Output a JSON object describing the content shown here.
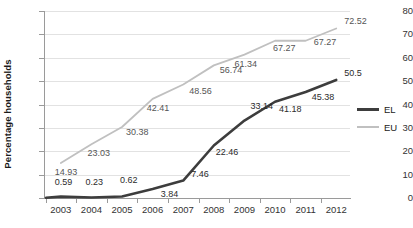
{
  "chart_data": {
    "type": "line",
    "title": "",
    "xlabel": "",
    "ylabel": "Percentage households",
    "categories": [
      "2003",
      "2004",
      "2005",
      "2006",
      "2007",
      "2008",
      "2009",
      "2010",
      "2011",
      "2012"
    ],
    "ylim": [
      0,
      80
    ],
    "yticks": [
      0,
      10,
      20,
      30,
      40,
      50,
      60,
      70,
      80
    ],
    "grid": true,
    "legend_position": "right",
    "series": [
      {
        "name": "EL",
        "color": "#3d3d3d",
        "values": [
          0.59,
          0.23,
          0.62,
          3.84,
          7.46,
          22.46,
          33.14,
          41.18,
          45.38,
          50.5
        ],
        "labels": [
          "0.59",
          "0.23",
          "0.62",
          "3.84",
          "7.46",
          "22.46",
          "33.14",
          "41.18",
          "45.38",
          "50.5"
        ]
      },
      {
        "name": "EU",
        "color": "#c0c0c0",
        "values": [
          14.93,
          23.03,
          30.38,
          42.41,
          48.56,
          56.74,
          61.34,
          67.27,
          67.27,
          72.52
        ],
        "labels": [
          "14.93",
          "23.03",
          "30.38",
          "42.41",
          "48.56",
          "56.74",
          "61.34",
          "67.27",
          "67.27",
          "72.52"
        ]
      }
    ]
  },
  "legend": {
    "items": [
      {
        "label": "EL"
      },
      {
        "label": "EU"
      }
    ]
  },
  "axis": {
    "y_tick_labels": [
      "0",
      "10",
      "20",
      "30",
      "40",
      "50",
      "60",
      "70",
      "80"
    ],
    "x_tick_labels": [
      "2003",
      "2004",
      "2005",
      "2006",
      "2007",
      "2008",
      "2009",
      "2010",
      "2011",
      "2012"
    ],
    "y_axis_title": "Percentage households"
  }
}
